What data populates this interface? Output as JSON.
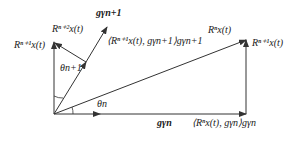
{
  "diagram": {
    "labels": {
      "r_n1_left": "Rⁿ⁺¹x(t)",
      "r_n2": "Rⁿ⁺²x(t)",
      "g_n1": "gγn+1",
      "proj_n1": "⟨Rⁿ⁺¹x(t), gγn+1⟩gγn+1",
      "r_n": "Rⁿx(t)",
      "r_n1_right": "Rⁿ⁺¹x(t)",
      "theta_n1": "θn+1",
      "theta_n": "θn",
      "g_n": "gγn",
      "proj_n": "⟨Rⁿx(t), gγn⟩gγn"
    },
    "colors": {
      "line": "#333333",
      "text": "#1a1a1a"
    }
  }
}
